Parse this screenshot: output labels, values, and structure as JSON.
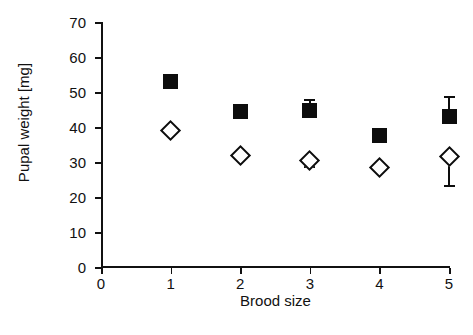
{
  "chart_data": {
    "type": "scatter",
    "title": "",
    "xlabel": "Brood size",
    "ylabel": "Pupal weight [mg]",
    "xlim": [
      0,
      5
    ],
    "ylim": [
      0,
      70
    ],
    "x_ticks": [
      0,
      1,
      2,
      3,
      4,
      5
    ],
    "y_ticks": [
      0,
      10,
      20,
      30,
      40,
      50,
      60,
      70
    ],
    "grid": false,
    "legend": "none",
    "x": [
      1,
      2,
      3,
      4,
      5
    ],
    "series": [
      {
        "name": "filled-square",
        "marker": "filled square",
        "color": "#0d0d0d",
        "values": [
          53,
          44.3,
          44.8,
          37.5,
          43
        ],
        "err_up": [
          0,
          1.3,
          3.3,
          2.3,
          6
        ],
        "err_down": [
          0,
          1.3,
          0,
          0,
          0
        ]
      },
      {
        "name": "open-diamond",
        "marker": "open diamond",
        "color": "#0d0d0d",
        "values": [
          39,
          32,
          30.5,
          28.5,
          31.5
        ],
        "err_up": [
          0,
          0,
          0,
          0,
          0
        ],
        "err_down": [
          0,
          0,
          1.5,
          0,
          8
        ]
      }
    ]
  },
  "axes": {
    "y_tick_labels": [
      "0",
      "10",
      "20",
      "30",
      "40",
      "50",
      "60",
      "70"
    ],
    "x_tick_labels": [
      "0",
      "1",
      "2",
      "3",
      "4",
      "5"
    ],
    "x_title": "Brood size",
    "y_title": "Pupal weight [mg]"
  }
}
